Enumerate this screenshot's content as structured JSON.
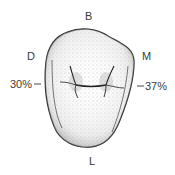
{
  "diagram": {
    "labels": {
      "buccal": "B",
      "distal": "D",
      "mesial": "M",
      "lingual": "L"
    },
    "percentages": {
      "distal": "30%",
      "mesial": "37%"
    },
    "colors": {
      "outline": "#2a2a2a",
      "stipple": "#555555",
      "text": "#3a3a3a"
    }
  }
}
